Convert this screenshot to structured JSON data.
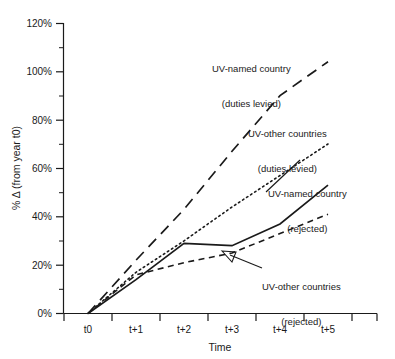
{
  "chart_data": {
    "type": "line",
    "title": "",
    "xlabel": "Time",
    "ylabel": "% Δ (from year t0)",
    "categories": [
      "t0",
      "t+1",
      "t+2",
      "t+3",
      "t+4",
      "t+5"
    ],
    "ylim": [
      0,
      120
    ],
    "ytick_labels": [
      "0%",
      "20%",
      "40%",
      "60%",
      "80%",
      "100%",
      "120%"
    ],
    "ytick_values": [
      0,
      20,
      40,
      60,
      80,
      100,
      120
    ],
    "minor_tick_step": 10,
    "grid": false,
    "legend": "annotations-inline",
    "series": [
      {
        "name": "UV-named country (duties levied)",
        "line_style": "long-dash",
        "color": "#1a1a1a",
        "values": [
          0,
          22,
          43,
          67,
          90,
          104
        ]
      },
      {
        "name": "UV-other countries (duties levied)",
        "line_style": "dotted",
        "color": "#1a1a1a",
        "values": [
          0,
          17,
          30,
          44,
          57,
          70
        ]
      },
      {
        "name": "UV-named country (rejected)",
        "line_style": "solid",
        "color": "#1a1a1a",
        "values": [
          0,
          14,
          29,
          28,
          37,
          53
        ]
      },
      {
        "name": "UV-other countries (rejected)",
        "line_style": "short-dash",
        "color": "#1a1a1a",
        "values": [
          0,
          16,
          21,
          25,
          33,
          41
        ]
      }
    ],
    "annotations": [
      {
        "id": "uvnamed-duties",
        "line1": "UV-named country",
        "line2": "(duties levied)",
        "leader": false
      },
      {
        "id": "uvother-duties",
        "line1": "UV-other countries",
        "line2": "(duties levied)",
        "leader": false
      },
      {
        "id": "uvnamed-rejected",
        "line1": "UV-named country",
        "line2": "(rejected)",
        "leader": true
      },
      {
        "id": "uvother-rejected",
        "line1": "UV-other countries",
        "line2": "(rejected)",
        "leader": true,
        "arrow": true
      }
    ]
  },
  "axes": {
    "x_title": "Time",
    "y_title": "% Δ (from year t0)",
    "x_categories": [
      "t0",
      "t+1",
      "t+2",
      "t+3",
      "t+4",
      "t+5"
    ],
    "y_labels": [
      "120%",
      "100%",
      "80%",
      "60%",
      "40%",
      "20%",
      "0%"
    ]
  }
}
